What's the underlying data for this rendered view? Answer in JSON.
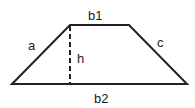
{
  "diagram": {
    "type": "trapezoid",
    "labels": {
      "top_base": "b1",
      "bottom_base": "b2",
      "left_side": "a",
      "right_side": "c",
      "height": "h"
    },
    "colors": {
      "stroke": "#222222",
      "background": "#ffffff"
    }
  }
}
